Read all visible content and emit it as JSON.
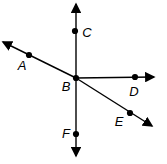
{
  "figure": {
    "type": "geometry-diagram",
    "background_color": "#ffffff",
    "stroke_color": "#000000",
    "label_color": "#000000",
    "canvas": {
      "width": 167,
      "height": 164
    },
    "stroke_width": 1.4,
    "dot_radius": 3.1,
    "label_font_size": 13,
    "lines": [
      {
        "id": "ray-B-toward-A",
        "x1": 76,
        "y1": 78,
        "x2": 3,
        "y2": 42,
        "arrow_start": false,
        "arrow_end": true
      },
      {
        "id": "ray-B-toward-E",
        "x1": 76,
        "y1": 78,
        "x2": 152,
        "y2": 126,
        "arrow_start": false,
        "arrow_end": true
      },
      {
        "id": "line-vertical-through-B",
        "x1": 76,
        "y1": 156,
        "x2": 76,
        "y2": 4,
        "arrow_start": true,
        "arrow_end": true
      },
      {
        "id": "ray-B-toward-D",
        "x1": 76,
        "y1": 78,
        "x2": 154,
        "y2": 77,
        "arrow_start": false,
        "arrow_end": true
      }
    ],
    "points": [
      {
        "label": "A",
        "x": 29,
        "y": 55,
        "lx": 22,
        "ly": 70
      },
      {
        "label": "B",
        "x": 76,
        "y": 78,
        "lx": 66,
        "ly": 91
      },
      {
        "label": "C",
        "x": 75,
        "y": 31,
        "lx": 87,
        "ly": 37
      },
      {
        "label": "D",
        "x": 135,
        "y": 77,
        "lx": 134,
        "ly": 96
      },
      {
        "label": "E",
        "x": 130,
        "y": 113,
        "lx": 119,
        "ly": 126
      },
      {
        "label": "F",
        "x": 76,
        "y": 134,
        "lx": 66,
        "ly": 138
      }
    ]
  }
}
